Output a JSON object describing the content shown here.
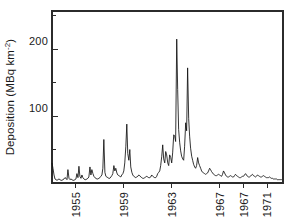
{
  "chart_data": {
    "type": "line",
    "title": "",
    "subtitle": "",
    "xlabel": "",
    "ylabel": "Deposition (MBq km⁻²)",
    "ylabel_text": "Deposition (MBq km",
    "ylabel_sup": "-2",
    "ylabel_close": ")",
    "grid": false,
    "legend": false,
    "legend_position": "none",
    "xlim": [
      1953.0,
      1972.3
    ],
    "ylim": [
      0,
      257
    ],
    "ytick_values": [
      100,
      200
    ],
    "ytick_labels": [
      "100",
      "200"
    ],
    "yminor_values": [
      50,
      150,
      250
    ],
    "xtick_values": [
      1955,
      1959,
      1963,
      1967,
      1969,
      1971
    ],
    "xtick_labels": [
      "1955",
      "1959",
      "1963",
      "1967",
      "1967",
      "1971"
    ],
    "series": [
      {
        "name": "Deposition",
        "color": "#111111",
        "x": [
          1953.0,
          1953.08,
          1953.17,
          1953.25,
          1953.33,
          1953.42,
          1953.5,
          1953.58,
          1953.67,
          1953.75,
          1953.83,
          1953.92,
          1954.0,
          1954.08,
          1954.17,
          1954.25,
          1954.33,
          1954.42,
          1954.5,
          1954.58,
          1954.67,
          1954.75,
          1954.83,
          1954.92,
          1955.0,
          1955.08,
          1955.17,
          1955.25,
          1955.33,
          1955.42,
          1955.5,
          1955.58,
          1955.67,
          1955.75,
          1955.83,
          1955.92,
          1956.0,
          1956.08,
          1956.17,
          1956.25,
          1956.33,
          1956.42,
          1956.5,
          1956.58,
          1956.67,
          1956.75,
          1956.83,
          1956.92,
          1957.0,
          1957.08,
          1957.17,
          1957.25,
          1957.33,
          1957.42,
          1957.5,
          1957.58,
          1957.67,
          1957.75,
          1957.83,
          1957.92,
          1958.0,
          1958.08,
          1958.17,
          1958.25,
          1958.33,
          1958.42,
          1958.5,
          1958.58,
          1958.67,
          1958.75,
          1958.83,
          1958.92,
          1959.0,
          1959.08,
          1959.17,
          1959.25,
          1959.33,
          1959.42,
          1959.5,
          1959.58,
          1959.67,
          1959.75,
          1959.83,
          1959.92,
          1960.0,
          1960.08,
          1960.17,
          1960.25,
          1960.33,
          1960.42,
          1960.5,
          1960.58,
          1960.67,
          1960.75,
          1960.83,
          1960.92,
          1961.0,
          1961.08,
          1961.17,
          1961.25,
          1961.33,
          1961.42,
          1961.5,
          1961.58,
          1961.67,
          1961.75,
          1961.83,
          1961.92,
          1962.0,
          1962.08,
          1962.17,
          1962.25,
          1962.33,
          1962.42,
          1962.5,
          1962.58,
          1962.67,
          1962.75,
          1962.83,
          1962.92,
          1963.0,
          1963.08,
          1963.17,
          1963.25,
          1963.33,
          1963.42,
          1963.5,
          1963.58,
          1963.67,
          1963.75,
          1963.83,
          1963.92,
          1964.0,
          1964.08,
          1964.17,
          1964.25,
          1964.33,
          1964.42,
          1964.5,
          1964.58,
          1964.67,
          1964.75,
          1964.83,
          1964.92,
          1965.0,
          1965.08,
          1965.17,
          1965.25,
          1965.33,
          1965.42,
          1965.5,
          1965.58,
          1965.67,
          1965.75,
          1965.83,
          1965.92,
          1966.0,
          1966.08,
          1966.17,
          1966.25,
          1966.33,
          1966.42,
          1966.5,
          1966.58,
          1966.67,
          1966.75,
          1966.83,
          1966.92,
          1967.0,
          1967.08,
          1967.17,
          1967.25,
          1967.33,
          1967.42,
          1967.5,
          1967.58,
          1967.67,
          1967.75,
          1967.83,
          1967.92,
          1968.0,
          1968.08,
          1968.17,
          1968.25,
          1968.33,
          1968.42,
          1968.5,
          1968.58,
          1968.67,
          1968.75,
          1968.83,
          1968.92,
          1969.0,
          1969.08,
          1969.17,
          1969.25,
          1969.33,
          1969.42,
          1969.5,
          1969.58,
          1969.67,
          1969.75,
          1969.83,
          1969.92,
          1970.0,
          1970.08,
          1970.17,
          1970.25,
          1970.33,
          1970.42,
          1970.5,
          1970.58,
          1970.67,
          1970.75,
          1970.83,
          1970.92,
          1971.0,
          1971.08,
          1971.17,
          1971.25,
          1971.33,
          1971.42,
          1971.5,
          1971.58,
          1971.67,
          1971.75,
          1971.83,
          1971.92,
          1972.0,
          1972.1,
          1972.2
        ],
        "values": [
          30,
          22,
          12,
          6,
          5,
          4,
          5,
          6,
          5,
          4,
          4,
          5,
          6,
          8,
          7,
          5,
          20,
          7,
          5,
          6,
          5,
          4,
          4,
          5,
          6,
          14,
          8,
          25,
          10,
          7,
          12,
          8,
          6,
          5,
          5,
          6,
          7,
          9,
          24,
          12,
          20,
          14,
          10,
          8,
          7,
          6,
          6,
          7,
          8,
          10,
          12,
          22,
          65,
          16,
          10,
          9,
          8,
          7,
          7,
          9,
          11,
          14,
          26,
          18,
          22,
          15,
          12,
          11,
          10,
          9,
          12,
          14,
          18,
          30,
          55,
          88,
          44,
          34,
          50,
          24,
          16,
          12,
          10,
          9,
          8,
          9,
          10,
          12,
          11,
          9,
          8,
          7,
          7,
          8,
          9,
          10,
          9,
          8,
          8,
          9,
          12,
          10,
          9,
          8,
          8,
          10,
          14,
          16,
          18,
          26,
          40,
          57,
          36,
          30,
          47,
          42,
          30,
          26,
          42,
          38,
          30,
          45,
          72,
          70,
          62,
          215,
          140,
          80,
          60,
          48,
          40,
          36,
          34,
          55,
          90,
          78,
          172,
          96,
          70,
          52,
          40,
          34,
          28,
          24,
          22,
          26,
          38,
          30,
          26,
          22,
          18,
          16,
          15,
          14,
          13,
          14,
          15,
          18,
          22,
          20,
          17,
          15,
          13,
          12,
          11,
          11,
          12,
          13,
          12,
          11,
          10,
          13,
          18,
          15,
          12,
          10,
          9,
          9,
          10,
          11,
          10,
          9,
          9,
          11,
          13,
          11,
          10,
          9,
          8,
          8,
          9,
          10,
          10,
          12,
          14,
          12,
          10,
          9,
          9,
          10,
          12,
          13,
          11,
          10,
          9,
          10,
          12,
          11,
          10,
          9,
          9,
          10,
          11,
          10,
          9,
          8,
          8,
          8,
          9,
          8,
          7,
          7,
          6,
          6,
          6,
          6,
          5,
          5,
          5,
          5,
          5
        ]
      }
    ],
    "annotations": [
      {
        "label": "peak-1963",
        "x": 1963.42,
        "y": 215
      },
      {
        "label": "peak-1964",
        "x": 1964.33,
        "y": 172
      },
      {
        "label": "peak-1959",
        "x": 1959.25,
        "y": 88
      },
      {
        "label": "peak-1964-early",
        "x": 1964.17,
        "y": 90
      }
    ]
  }
}
